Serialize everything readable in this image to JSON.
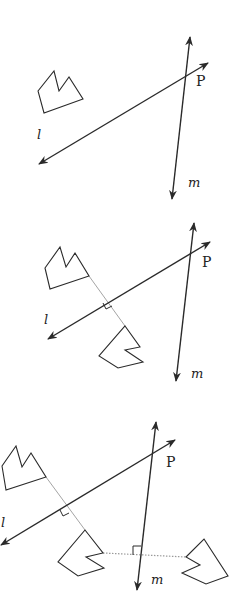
{
  "colors": {
    "stroke": "#2a2a2a",
    "construction": "#9a9a9a",
    "background": "#ffffff"
  },
  "panels": [
    {
      "id": "panel-1",
      "caption_labels": {
        "line_l": "l",
        "line_m": "m",
        "point": "P"
      },
      "line_l": {
        "from": [
          39,
          164
        ],
        "to": [
          208,
          63
        ]
      },
      "line_m": {
        "from": [
          172,
          199
        ],
        "to": [
          190,
          37
        ]
      },
      "labels": {
        "l": [
          37,
          128
        ],
        "m": [
          188,
          176
        ],
        "P": [
          196,
          74
        ]
      },
      "shapes": [
        {
          "name": "original-figure",
          "points": [
            [
              38,
              91
            ],
            [
              54,
              71
            ],
            [
              59,
              91
            ],
            [
              69,
              77
            ],
            [
              83,
              99
            ],
            [
              44,
              113
            ]
          ]
        }
      ],
      "perpendiculars": []
    },
    {
      "id": "panel-2",
      "caption_labels": {
        "line_l": "l",
        "line_m": "m",
        "point": "P"
      },
      "line_l": {
        "from": [
          48,
          339
        ],
        "to": [
          210,
          242
        ]
      },
      "line_m": {
        "from": [
          176,
          381
        ],
        "to": [
          194,
          223
        ]
      },
      "labels": {
        "l": [
          44,
          313
        ],
        "m": [
          191,
          367
        ],
        "P": [
          202,
          255
        ]
      },
      "shapes": [
        {
          "name": "original-figure",
          "points": [
            [
              45,
              268
            ],
            [
              60,
              247
            ],
            [
              66,
              267
            ],
            [
              75,
              253
            ],
            [
              89,
              276
            ],
            [
              50,
              289
            ]
          ]
        },
        {
          "name": "reflection-across-l",
          "points": [
            [
              125,
              326
            ],
            [
              140,
              347
            ],
            [
              125,
              350
            ],
            [
              143,
              362
            ],
            [
              118,
              368
            ],
            [
              99,
              356
            ]
          ]
        }
      ],
      "perpendiculars": [
        {
          "name": "perpendicular-to-l",
          "from": [
            89,
            276
          ],
          "to": [
            125,
            326
          ],
          "style": "solid-thin",
          "right_angle": [
            [
              103,
              303
            ],
            [
              106,
              309
            ],
            [
              112,
              306
            ]
          ]
        }
      ]
    },
    {
      "id": "panel-3",
      "caption_labels": {
        "line_l": "l",
        "line_m": "m",
        "point": "P"
      },
      "line_l": {
        "from": [
          1,
          545
        ],
        "to": [
          175,
          440
        ]
      },
      "line_m": {
        "from": [
          137,
          590
        ],
        "to": [
          156,
          422
        ]
      },
      "labels": {
        "l": [
          1,
          516
        ],
        "m": [
          151,
          573
        ],
        "P": [
          166,
          455
        ]
      },
      "shapes": [
        {
          "name": "original-figure",
          "points": [
            [
              2,
              466
            ],
            [
              16,
              446
            ],
            [
              22,
              467
            ],
            [
              31,
              453
            ],
            [
              46,
              477
            ],
            [
              6,
              490
            ]
          ]
        },
        {
          "name": "reflection-across-l",
          "points": [
            [
              85,
              530
            ],
            [
              103,
              553
            ],
            [
              86,
              557
            ],
            [
              104,
              568
            ],
            [
              78,
              576
            ],
            [
              58,
              562
            ]
          ]
        },
        {
          "name": "reflection-across-m",
          "points": [
            [
              204,
              539
            ],
            [
              228,
              576
            ],
            [
              206,
              584
            ],
            [
              182,
              573
            ],
            [
              200,
              565
            ],
            [
              186,
              557
            ]
          ]
        }
      ],
      "perpendiculars": [
        {
          "name": "perpendicular-to-l",
          "from": [
            46,
            477
          ],
          "to": [
            85,
            530
          ],
          "style": "solid-thin",
          "right_angle": [
            [
              60,
              510
            ],
            [
              63,
              516
            ],
            [
              69,
              513
            ]
          ]
        },
        {
          "name": "perpendicular-to-m",
          "from": [
            103,
            553
          ],
          "to": [
            186,
            557
          ],
          "style": "dotted",
          "right_angle": [
            [
              133,
              555
            ],
            [
              133,
              546
            ],
            [
              141,
              546
            ]
          ]
        }
      ]
    }
  ]
}
